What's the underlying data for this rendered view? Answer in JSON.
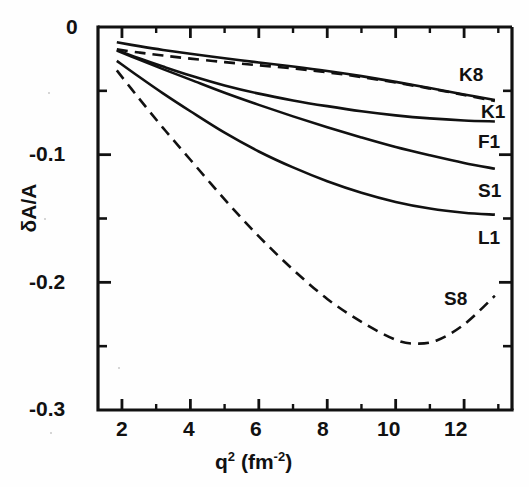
{
  "chart_data": {
    "type": "line",
    "title": "",
    "xlabel": "q² (fm⁻²)",
    "ylabel": "δA/A",
    "xlim": [
      1.3,
      13.4
    ],
    "ylim": [
      -0.3,
      0.0
    ],
    "grid": false,
    "legend": "inline-right-of-curve-ends",
    "xticks": [
      2,
      4,
      6,
      8,
      10,
      12
    ],
    "xtick_labels": [
      "2",
      "4",
      "6",
      "8",
      "10",
      "12"
    ],
    "xminor_ticks": [
      3,
      5,
      7,
      9,
      11,
      13
    ],
    "yticks": [
      0.0,
      -0.1,
      -0.2,
      -0.3
    ],
    "ytick_labels": [
      "0",
      "-0.1",
      "-0.2",
      "-0.3"
    ],
    "yminor_ticks": [
      -0.05,
      -0.15,
      -0.25
    ],
    "series": [
      {
        "name": "K8",
        "label": "K8",
        "style": "dashed",
        "x": [
          1.85,
          2.5,
          3.2,
          4.0,
          5.0,
          6.0,
          7.0,
          8.0,
          9.0,
          10.0,
          11.0,
          12.0,
          12.9
        ],
        "y": [
          -0.0175,
          -0.02,
          -0.0223,
          -0.0248,
          -0.0275,
          -0.03,
          -0.0325,
          -0.0355,
          -0.0392,
          -0.0435,
          -0.0482,
          -0.0532,
          -0.058
        ]
      },
      {
        "name": "K1",
        "label": "K1",
        "style": "solid",
        "x": [
          1.85,
          2.5,
          3.2,
          4.0,
          5.0,
          6.0,
          7.0,
          8.0,
          9.0,
          10.0,
          11.0,
          12.0,
          12.9
        ],
        "y": [
          -0.012,
          -0.015,
          -0.018,
          -0.021,
          -0.0245,
          -0.0278,
          -0.031,
          -0.0345,
          -0.0385,
          -0.043,
          -0.0478,
          -0.0528,
          -0.0572
        ]
      },
      {
        "name": "F1",
        "label": "F1",
        "style": "solid",
        "x": [
          1.85,
          2.5,
          3.2,
          4.0,
          5.0,
          6.0,
          7.0,
          8.0,
          9.0,
          10.0,
          11.0,
          12.0,
          12.9
        ],
        "y": [
          -0.018,
          -0.0245,
          -0.031,
          -0.038,
          -0.0458,
          -0.0522,
          -0.0575,
          -0.062,
          -0.066,
          -0.0692,
          -0.0716,
          -0.0732,
          -0.074
        ]
      },
      {
        "name": "S1",
        "label": "S1",
        "style": "solid",
        "x": [
          1.85,
          2.5,
          3.2,
          4.0,
          5.0,
          6.0,
          7.0,
          8.0,
          9.0,
          10.0,
          11.0,
          12.0,
          12.9
        ],
        "y": [
          -0.0185,
          -0.0255,
          -0.033,
          -0.0412,
          -0.0515,
          -0.061,
          -0.07,
          -0.0785,
          -0.0865,
          -0.094,
          -0.1005,
          -0.1065,
          -0.111
        ]
      },
      {
        "name": "L1",
        "label": "L1",
        "style": "solid",
        "x": [
          1.85,
          2.5,
          3.2,
          4.0,
          5.0,
          6.0,
          7.0,
          8.0,
          9.0,
          10.0,
          11.0,
          12.0,
          12.9
        ],
        "y": [
          -0.0265,
          -0.039,
          -0.052,
          -0.066,
          -0.0828,
          -0.0975,
          -0.11,
          -0.1208,
          -0.1298,
          -0.137,
          -0.1422,
          -0.1455,
          -0.147
        ]
      },
      {
        "name": "S8",
        "label": "S8",
        "style": "dashed",
        "x": [
          1.85,
          2.5,
          3.2,
          4.0,
          5.0,
          6.0,
          7.0,
          8.0,
          9.0,
          10.0,
          10.6,
          11.2,
          12.0,
          12.9
        ],
        "y": [
          -0.034,
          -0.056,
          -0.079,
          -0.104,
          -0.135,
          -0.164,
          -0.19,
          -0.213,
          -0.231,
          -0.245,
          -0.248,
          -0.2455,
          -0.233,
          -0.2105
        ]
      }
    ]
  },
  "axis": {
    "ylabel_text": "δA/A",
    "xlabel_base": "q",
    "xlabel_exp": "2",
    "xlabel_unit_open": " (fm",
    "xlabel_unit_exp": "-2",
    "xlabel_unit_close": ")"
  },
  "labels": {
    "k8": "K8",
    "k1": "K1",
    "f1": "F1",
    "s1": "S1",
    "l1": "L1",
    "s8": "S8"
  },
  "style": {
    "ink": "#111111",
    "paper": "#fefefe",
    "axis_width": 3.2,
    "curve_width": 2.6
  }
}
